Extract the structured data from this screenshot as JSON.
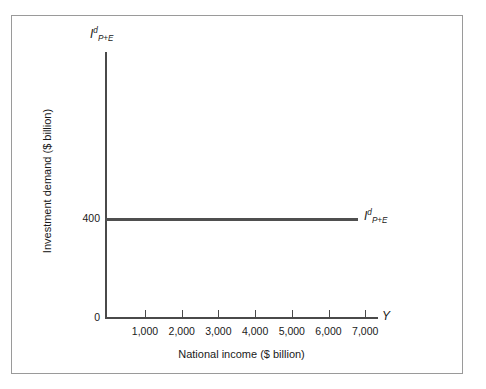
{
  "chart_data": {
    "type": "line",
    "title": "",
    "xlabel": "National income ($ billion)",
    "ylabel": "Investment demand ($ billion)",
    "x_axis_variable": "Y",
    "y_axis_variable": "I",
    "y_axis_variable_sup": "d",
    "y_axis_variable_sub": "P+E",
    "categories": [
      "1,000",
      "2,000",
      "3,000",
      "4,000",
      "5,000",
      "6,000",
      "7,000"
    ],
    "x_tick_values": [
      1000,
      2000,
      3000,
      4000,
      5000,
      6000,
      7000
    ],
    "xlim": [
      0,
      7600
    ],
    "ylim": [
      0,
      1000
    ],
    "y_tick_labels": [
      "0",
      "400"
    ],
    "y_tick_values": [
      0,
      400
    ],
    "grid": false,
    "legend": "none",
    "series": [
      {
        "name": "I",
        "name_sup": "d",
        "name_sub": "P+E",
        "label_position": "right-end",
        "x": [
          0,
          1000,
          2000,
          3000,
          4000,
          5000,
          6000,
          7000
        ],
        "values": [
          400,
          400,
          400,
          400,
          400,
          400,
          400,
          400
        ],
        "color": "#4f4f4f"
      }
    ],
    "annotations": [
      {
        "text": "400",
        "position": "y-axis-tick"
      },
      {
        "text": "0",
        "position": "origin"
      },
      {
        "text": "Y",
        "position": "x-axis-end"
      }
    ]
  },
  "axis": {
    "origin_label": "0",
    "value_400": "400",
    "x_end_symbol": "Y"
  },
  "labels": {
    "x_title": "National income ($ billion)",
    "y_title": "Investment demand ($ billion)",
    "symbol_base": "I",
    "symbol_sup": "d",
    "symbol_sub": "P+E"
  }
}
